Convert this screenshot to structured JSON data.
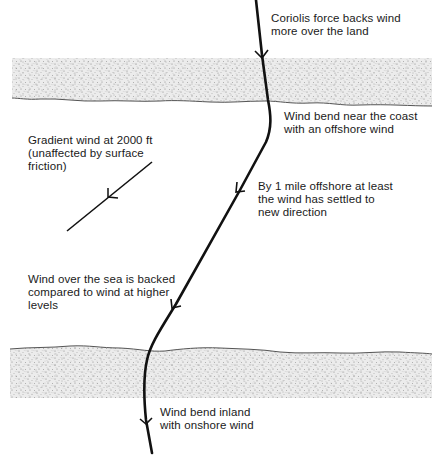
{
  "diagram": {
    "colors": {
      "land_fill": "#e6e6e6",
      "land_speckle": "#7a7a7a",
      "coastline": "#555555",
      "wind_line": "#111111",
      "text": "#1a1a1a"
    },
    "regions": [
      {
        "name": "upper-land",
        "type": "land"
      },
      {
        "name": "sea",
        "type": "sea"
      },
      {
        "name": "lower-land",
        "type": "land"
      }
    ],
    "annotations": {
      "coriolis": {
        "line1": "Coriolis force backs wind",
        "line2": "more over the land"
      },
      "bend_offshore": {
        "line1": "Wind bend near the coast",
        "line2": "with an offshore wind"
      },
      "gradient": {
        "line1": "Gradient wind at 2000 ft",
        "line2": "(unaffected by surface",
        "line3": "friction)"
      },
      "settled": {
        "line1": "By 1 mile offshore at least",
        "line2": "the wind has settled to",
        "line3": "new direction"
      },
      "backed": {
        "line1": "Wind over the sea is backed",
        "line2": "compared to wind at higher",
        "line3": "levels"
      },
      "bend_inland": {
        "line1": "Wind bend inland",
        "line2": "with onshore wind"
      }
    },
    "arrows": [
      {
        "name": "surface-wind-path",
        "arrowheads": 4
      },
      {
        "name": "gradient-wind",
        "arrowheads": 1
      }
    ]
  }
}
